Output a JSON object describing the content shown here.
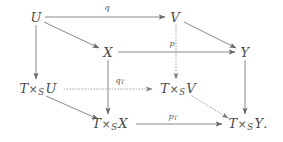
{
  "diagram": {
    "stroke_color": "#6b6b6b",
    "text_color": "#4a4a4a",
    "background": "#ffffff",
    "nodes": [
      {
        "id": "U",
        "label": "U",
        "x": 36,
        "y": 17,
        "parts": {
          "base": "U"
        }
      },
      {
        "id": "V",
        "label": "V",
        "x": 175,
        "y": 17,
        "parts": {
          "base": "V"
        }
      },
      {
        "id": "X",
        "label": "X",
        "x": 108,
        "y": 52,
        "parts": {
          "base": "X"
        }
      },
      {
        "id": "Y",
        "label": "Y",
        "x": 245,
        "y": 52,
        "parts": {
          "base": "Y"
        }
      },
      {
        "id": "TxsU",
        "label": "T ×S U",
        "x": 38,
        "y": 89,
        "parts": {
          "t": "T",
          "times": "×",
          "sub": "S",
          "base": "U"
        }
      },
      {
        "id": "TxsV",
        "label": "T ×S V",
        "x": 178,
        "y": 89,
        "parts": {
          "t": "T",
          "times": "×",
          "sub": "S",
          "base": "V"
        }
      },
      {
        "id": "TxsX",
        "label": "T ×S X",
        "x": 110,
        "y": 124,
        "parts": {
          "t": "T",
          "times": "×",
          "sub": "S",
          "base": "X"
        }
      },
      {
        "id": "TxsY",
        "label": "T ×S Y.",
        "x": 248,
        "y": 124,
        "parts": {
          "t": "T",
          "times": "×",
          "sub": "S",
          "base": "Y",
          "period": "."
        }
      }
    ],
    "edges": [
      {
        "id": "U-V",
        "from": "U",
        "to": "V",
        "style": "solid",
        "label": "q",
        "label_sub": ""
      },
      {
        "id": "U-X",
        "from": "U",
        "to": "X",
        "style": "solid",
        "label": "",
        "label_sub": ""
      },
      {
        "id": "U-TxsU",
        "from": "U",
        "to": "TxsU",
        "style": "solid",
        "label": "",
        "label_sub": ""
      },
      {
        "id": "X-Y",
        "from": "X",
        "to": "Y",
        "style": "solid",
        "label": "p",
        "label_sub": ""
      },
      {
        "id": "V-Y",
        "from": "V",
        "to": "Y",
        "style": "solid",
        "label": "",
        "label_sub": ""
      },
      {
        "id": "V-TxsV",
        "from": "V",
        "to": "TxsV",
        "style": "dotted",
        "label": "",
        "label_sub": ""
      },
      {
        "id": "X-TxsX",
        "from": "X",
        "to": "TxsX",
        "style": "solid",
        "label": "",
        "label_sub": ""
      },
      {
        "id": "Y-TxsY",
        "from": "Y",
        "to": "TxsY",
        "style": "solid",
        "label": "",
        "label_sub": ""
      },
      {
        "id": "TxsU-TxsV",
        "from": "TxsU",
        "to": "TxsV",
        "style": "dotted",
        "label": "q",
        "label_sub": "T"
      },
      {
        "id": "TxsU-TxsX",
        "from": "TxsU",
        "to": "TxsX",
        "style": "solid",
        "label": "",
        "label_sub": ""
      },
      {
        "id": "TxsX-TxsY",
        "from": "TxsX",
        "to": "TxsY",
        "style": "solid",
        "label": "p",
        "label_sub": "T"
      },
      {
        "id": "TxsV-TxsY",
        "from": "TxsV",
        "to": "TxsY",
        "style": "dotted",
        "label": "",
        "label_sub": ""
      }
    ],
    "labels": {
      "q": {
        "text": "q",
        "sub": "",
        "x": 107,
        "y": 8
      },
      "p": {
        "text": "p",
        "sub": "",
        "x": 172,
        "y": 44
      },
      "qT": {
        "text": "q",
        "sub": "T",
        "x": 120,
        "y": 81
      },
      "pT": {
        "text": "p",
        "sub": "T",
        "x": 173,
        "y": 117
      }
    }
  }
}
